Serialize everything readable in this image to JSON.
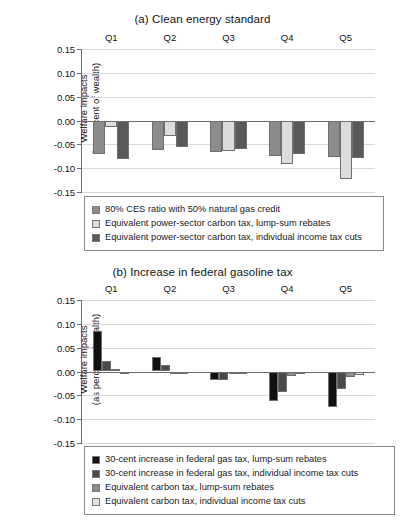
{
  "figure": {
    "y_axis_title_line1": "Welfare impacts",
    "y_axis_title_line2": "(as percent of wealth)"
  },
  "chart_data": [
    {
      "type": "bar",
      "title": "(a) Clean energy standard",
      "xlabel": "",
      "ylabel": "Welfare impacts (as percent of wealth)",
      "categories": [
        "Q1",
        "Q2",
        "Q3",
        "Q4",
        "Q5"
      ],
      "ylim": [
        -0.15,
        0.15
      ],
      "yticks": [
        0.15,
        0.1,
        0.05,
        0.0,
        -0.05,
        -0.1,
        -0.15
      ],
      "ytick_labels": [
        "0.15",
        "0.10",
        "0.05",
        "0.00",
        "-0.05",
        "-0.10",
        "-0.15"
      ],
      "grid": true,
      "legend_position": "below-plot",
      "series": [
        {
          "name": "80% CES ratio with 50% natural gas credit",
          "color": "#8c8c8c",
          "values": [
            -0.07,
            -0.061,
            -0.066,
            -0.074,
            -0.076
          ]
        },
        {
          "name": "Equivalent power-sector carbon tax, lump-sum rebates",
          "color": "#dcdcdc",
          "values": [
            -0.013,
            -0.033,
            -0.063,
            -0.092,
            -0.122
          ]
        },
        {
          "name": "Equivalent power-sector carbon tax, individual income tax cuts",
          "color": "#595959",
          "values": [
            -0.08,
            -0.055,
            -0.06,
            -0.071,
            -0.078
          ]
        }
      ]
    },
    {
      "type": "bar",
      "title": "(b) Increase in federal gasoline tax",
      "xlabel": "",
      "ylabel": "Welfare impacts (as percent of wealth)",
      "categories": [
        "Q1",
        "Q2",
        "Q3",
        "Q4",
        "Q5"
      ],
      "ylim": [
        -0.15,
        0.15
      ],
      "yticks": [
        0.15,
        0.1,
        0.05,
        0.0,
        -0.05,
        -0.1,
        -0.15
      ],
      "ytick_labels": [
        "0.15",
        "0.10",
        "0.05",
        "0.00",
        "-0.05",
        "-0.10",
        "-0.15"
      ],
      "grid": true,
      "legend_position": "below-plot",
      "series": [
        {
          "name": "30-cent increase in federal gas tax, lump-sum rebates",
          "color": "#111111",
          "values": [
            0.084,
            0.031,
            -0.018,
            -0.061,
            -0.075
          ]
        },
        {
          "name": "30-cent increase in federal gas tax, individual income tax cuts",
          "color": "#4a4a4a",
          "values": [
            0.023,
            0.013,
            -0.017,
            -0.044,
            -0.036
          ]
        },
        {
          "name": "Equivalent carbon tax, lump-sum rebates",
          "color": "#8c8c8c",
          "values": [
            0.006,
            -0.002,
            -0.004,
            -0.01,
            -0.011
          ]
        },
        {
          "name": "Equivalent carbon tax, individual income tax cuts",
          "color": "#e2e2e2",
          "values": [
            -0.002,
            -0.004,
            -0.004,
            -0.006,
            -0.007
          ]
        }
      ]
    }
  ]
}
